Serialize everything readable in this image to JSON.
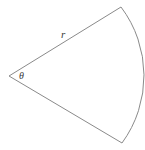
{
  "figure": {
    "background_color": "#ffffff",
    "stroke_color": "#8a8a8a",
    "label_color": "#3a3a3a",
    "labels": {
      "radius": "r",
      "angle": "θ"
    },
    "geometry": {
      "vertex_x": 9,
      "vertex_y": 76,
      "radius_px": 114,
      "arc_start_x": 121,
      "arc_start_y": 7,
      "arc_end_x": 122,
      "arc_end_y": 143,
      "arc_apex_x": 138,
      "arc_apex_y": 75,
      "sector_path": "M 9 76 L 121 7 A 114 114 0 0 1 122 143 Z"
    },
    "label_positions": {
      "radius_x": 61,
      "radius_y": 38,
      "angle_x": 19,
      "angle_y": 79
    }
  }
}
